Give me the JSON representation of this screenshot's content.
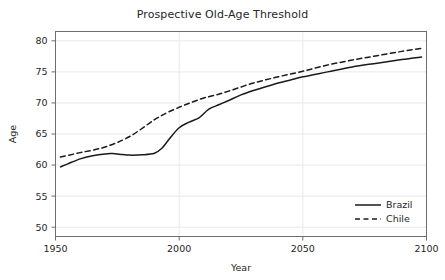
{
  "chart_data": {
    "type": "line",
    "title": "Prospective Old-Age Threshold",
    "xlabel": "Year",
    "ylabel": "Age",
    "xlim": [
      1950,
      2100
    ],
    "ylim": [
      48.5,
      81.5
    ],
    "xticks": [
      1950,
      2000,
      2050,
      2100
    ],
    "xtick_labels": [
      "1950",
      "2000",
      "2050",
      "2100"
    ],
    "yticks": [
      50,
      55,
      60,
      65,
      70,
      75,
      80
    ],
    "ytick_labels": [
      "50",
      "55",
      "60",
      "65",
      "70",
      "75",
      "80"
    ],
    "grid": true,
    "grid_color": "#e8e8e8",
    "legend_position": "lower right",
    "line_color": "#1a1a1a",
    "series": [
      {
        "name": "Brazil",
        "style": "solid",
        "x": [
          1952,
          1955,
          1960,
          1965,
          1970,
          1973,
          1977,
          1980,
          1985,
          1990,
          1993,
          1996,
          2000,
          2004,
          2008,
          2012,
          2016,
          2020,
          2025,
          2030,
          2035,
          2040,
          2045,
          2050,
          2060,
          2070,
          2080,
          2090,
          2098
        ],
        "values": [
          59.7,
          60.2,
          61.0,
          61.5,
          61.8,
          61.85,
          61.7,
          61.6,
          61.65,
          61.9,
          62.7,
          64.2,
          66.0,
          66.9,
          67.6,
          69.0,
          69.7,
          70.4,
          71.3,
          72.0,
          72.6,
          73.2,
          73.7,
          74.2,
          75.0,
          75.8,
          76.4,
          77.0,
          77.4
        ]
      },
      {
        "name": "Chile",
        "style": "dashed",
        "x": [
          1952,
          1960,
          1970,
          1980,
          1990,
          1995,
          2000,
          2005,
          2010,
          2015,
          2020,
          2030,
          2040,
          2050,
          2060,
          2070,
          2080,
          2090,
          2098
        ],
        "values": [
          61.3,
          62.0,
          62.9,
          64.6,
          67.3,
          68.4,
          69.3,
          70.1,
          70.8,
          71.3,
          71.9,
          73.2,
          74.2,
          75.1,
          76.1,
          76.9,
          77.6,
          78.3,
          78.8
        ]
      }
    ]
  },
  "legend": {
    "entries": [
      {
        "label": "Brazil",
        "style": "solid"
      },
      {
        "label": "Chile",
        "style": "dashed"
      }
    ]
  }
}
